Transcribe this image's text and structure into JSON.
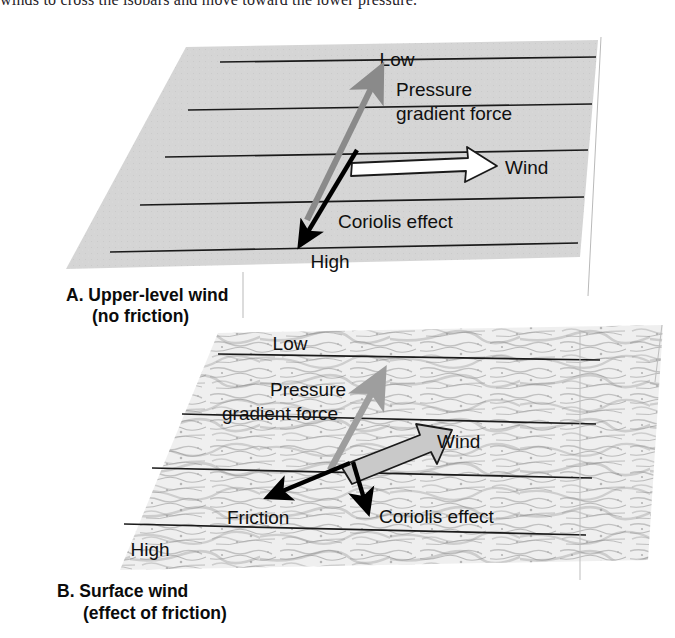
{
  "page": {
    "top_cut_sentence": "winds to cross the isobars and move toward the lower pressure."
  },
  "figure": {
    "colors": {
      "plane_a_fill": "#d4d4d4",
      "plane_b_fill": "#e8e8e8",
      "isobar": "#1a1a1a",
      "pressure_gradient_arrow": "#8a8a8a",
      "wind_arrow_a_fill": "#ffffff",
      "wind_arrow_b_fill": "#c9c9c9",
      "coriolis_arrow": "#000000",
      "friction_arrow": "#000000",
      "text": "#101010"
    },
    "panels": [
      {
        "id": "A",
        "caption_line1": "A. Upper-level wind",
        "caption_line2": "(no friction)",
        "surface_type": "smooth",
        "pressure_labels": {
          "low": "Low",
          "high": "High"
        },
        "isobar_count": 5,
        "vectors": [
          {
            "name": "pressure-gradient-force",
            "label_line1": "Pressure",
            "label_line2": "gradient force",
            "color": "#8a8a8a",
            "direction_deg": 62,
            "description": "points from High toward Low, perpendicular to isobars"
          },
          {
            "name": "wind",
            "label_line1": "Wind",
            "label_line2": "",
            "color": "#ffffff",
            "direction_deg": 0,
            "description": "blows parallel to the isobars (geostrophic)"
          },
          {
            "name": "coriolis-effect",
            "label_line1": "Coriolis effect",
            "label_line2": "",
            "color": "#000000",
            "direction_deg": 242,
            "description": "equal and opposite to the pressure gradient force"
          }
        ]
      },
      {
        "id": "B",
        "caption_line1": "B. Surface wind",
        "caption_line2": "(effect of friction)",
        "surface_type": "rough-textured",
        "pressure_labels": {
          "low": "Low",
          "high": "High"
        },
        "isobar_count": 4,
        "vectors": [
          {
            "name": "pressure-gradient-force",
            "label_line1": "Pressure",
            "label_line2": "gradient force",
            "color": "#8a8a8a",
            "direction_deg": 72,
            "description": "points from High toward Low, perpendicular to isobars"
          },
          {
            "name": "wind",
            "label_line1": "Wind",
            "label_line2": "",
            "color": "#c9c9c9",
            "direction_deg": 22,
            "description": "crosses the isobars at an angle toward lower pressure"
          },
          {
            "name": "friction",
            "label_line1": "Friction",
            "label_line2": "",
            "color": "#000000",
            "direction_deg": 200,
            "description": "acts opposite to wind direction, slowing the wind"
          },
          {
            "name": "coriolis-effect",
            "label_line1": "Coriolis effect",
            "label_line2": "",
            "color": "#000000",
            "direction_deg": 282,
            "description": "weakened because wind speed is reduced by friction"
          }
        ]
      }
    ]
  }
}
